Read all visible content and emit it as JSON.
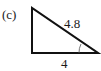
{
  "figure": {
    "part_label": "(c)",
    "shape": "right-triangle",
    "hypotenuse_label": "4.8",
    "base_label": "4",
    "marked_angle": "bottom-right vertex (unknown angle arc)",
    "colors": {
      "stroke": "#111111",
      "background": "#ffffff"
    }
  }
}
